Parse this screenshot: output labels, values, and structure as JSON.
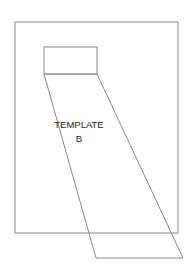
{
  "diagram": {
    "label_line1": "TEMPLATE",
    "label_line2": "B",
    "stroke_color": "#8a8a8a",
    "shapes": {
      "outer_frame": {
        "x": 15,
        "y": 22,
        "width": 163,
        "height": 211
      },
      "small_rect": {
        "x": 44,
        "y": 47,
        "width": 53,
        "height": 27
      },
      "projection": {
        "points": "44,74 97,74 183,258 96,258"
      }
    }
  }
}
